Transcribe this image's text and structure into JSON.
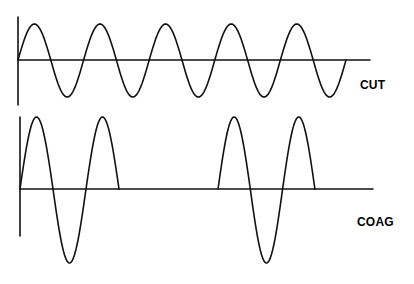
{
  "diagram": {
    "waveforms": [
      {
        "label": "CUT",
        "description": "continuous sine wave",
        "cycles": 5
      },
      {
        "label": "COAG",
        "description": "interrupted (damped burst) waveform",
        "bursts": 2,
        "cycles_per_burst": 1.5
      }
    ],
    "stroke_color": "#000000",
    "background": "#ffffff"
  }
}
